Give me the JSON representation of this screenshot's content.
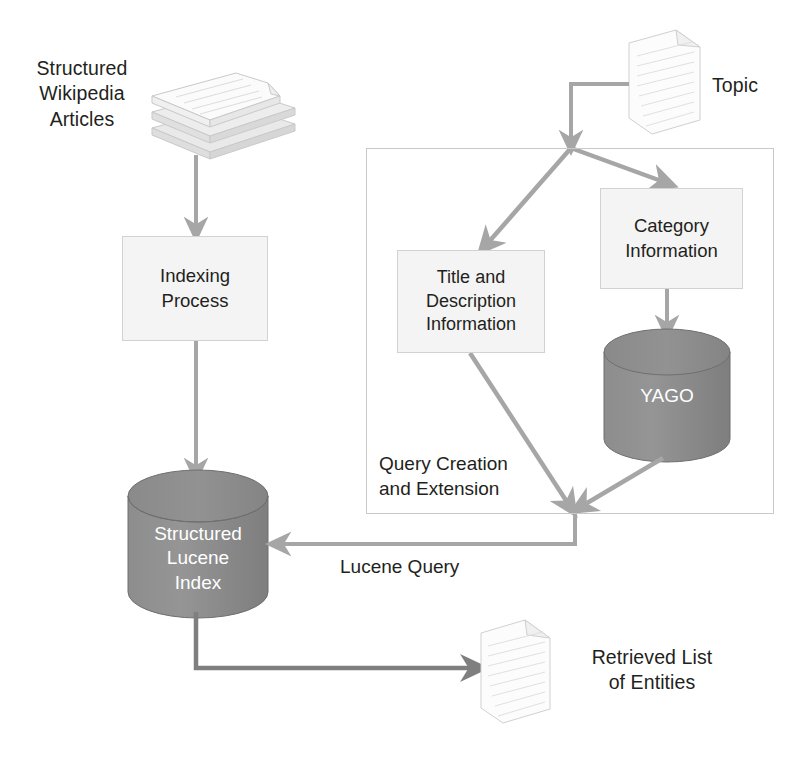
{
  "diagram": {
    "background": "#ffffff",
    "colors": {
      "arrow": "#a6a6a6",
      "arrow_dark": "#7f7f7f",
      "cylinder_fill": "#8b8b8b",
      "cylinder_stroke": "#6f6f6f",
      "box_fill": "#f4f4f4",
      "box_stroke": "#d2d2d2",
      "group_stroke": "#c9c9c9",
      "text": "#231f20",
      "doc_stroke": "#cccccc"
    }
  },
  "labels": {
    "structured_wikipedia_articles": "Structured\nWikipedia\nArticles",
    "topic": "Topic",
    "retrieved_list_of_entities": "Retrieved List\nof Entities",
    "lucene_query": "Lucene Query"
  },
  "nodes": {
    "indexing_process": "Indexing\nProcess",
    "structured_lucene_index": "Structured\nLucene\nIndex",
    "title_and_description_information": "Title and\nDescription\nInformation",
    "category_information": "Category\nInformation",
    "yago": "YAGO"
  },
  "groups": {
    "query_creation_and_extension": "Query Creation\nand Extension"
  },
  "icons": {
    "stacked_documents": "stacked-documents-icon",
    "topic_document": "document-icon",
    "result_document": "document-icon"
  },
  "edges": [
    {
      "from": "structured_wikipedia_articles",
      "to": "indexing_process",
      "label": ""
    },
    {
      "from": "indexing_process",
      "to": "structured_lucene_index",
      "label": ""
    },
    {
      "from": "topic",
      "to": "split_junction",
      "label": ""
    },
    {
      "from": "split_junction",
      "to": "title_and_description_information",
      "label": ""
    },
    {
      "from": "split_junction",
      "to": "category_information",
      "label": ""
    },
    {
      "from": "category_information",
      "to": "yago",
      "label": ""
    },
    {
      "from": "title_and_description_information",
      "to": "query_merge_point",
      "label": ""
    },
    {
      "from": "yago",
      "to": "query_merge_point",
      "label": ""
    },
    {
      "from": "query_merge_point",
      "to": "structured_lucene_index",
      "label": "Lucene Query"
    },
    {
      "from": "structured_lucene_index",
      "to": "retrieved_list_of_entities",
      "label": ""
    }
  ]
}
